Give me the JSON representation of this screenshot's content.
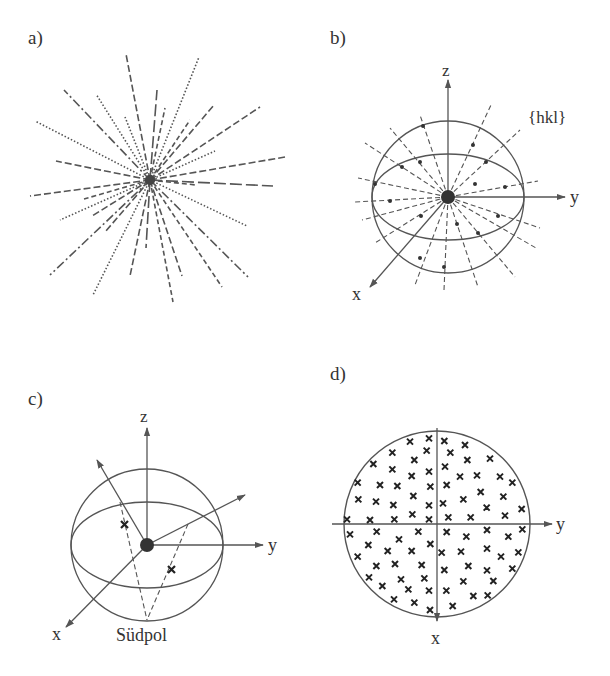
{
  "panels": {
    "a": {
      "label": "a)"
    },
    "b": {
      "label": "b)",
      "axis_z": "z",
      "axis_y": "y",
      "axis_x": "x",
      "plane_family": "{hkl}"
    },
    "c": {
      "label": "c)",
      "axis_z": "z",
      "axis_y": "y",
      "axis_x": "x",
      "south_pole": "Südpol"
    },
    "d": {
      "label": "d)",
      "axis_y": "y",
      "axis_x": "x"
    }
  },
  "colors": {
    "line": "#555555",
    "text": "#333333",
    "dot": "#333333"
  }
}
